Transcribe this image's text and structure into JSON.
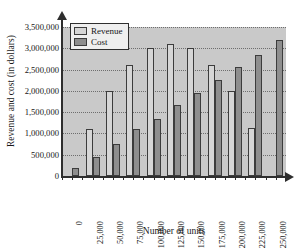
{
  "chart_data": {
    "type": "bar",
    "title": "",
    "xlabel": "Number of units",
    "ylabel": "Revenue and cost (in dollars)",
    "categories": [
      "0",
      "25,000",
      "50,000",
      "75,000",
      "100,000",
      "125,000",
      "150,000",
      "175,000",
      "200,000",
      "225,000",
      "250,000"
    ],
    "series": [
      {
        "name": "Revenue",
        "color": "#d6d6d6",
        "values": [
          0,
          1100000,
          2000000,
          2600000,
          3000000,
          3100000,
          3000000,
          2600000,
          2000000,
          1120000,
          0
        ]
      },
      {
        "name": "Cost",
        "color": "#8e8e8e",
        "values": [
          180000,
          450000,
          750000,
          1100000,
          1330000,
          1670000,
          1950000,
          2260000,
          2550000,
          2840000,
          3200000
        ]
      }
    ],
    "ylim": [
      0,
      3500000
    ],
    "ytick_labels": [
      "0",
      "500,000",
      "1,000,000",
      "1,500,000",
      "2,000,000",
      "2,500,000",
      "3,000,000",
      "3,500,000"
    ],
    "ytick_values": [
      0,
      500000,
      1000000,
      1500000,
      2000000,
      2500000,
      3000000,
      3500000
    ],
    "grid": true,
    "legend_position": "top-left",
    "legend_entries": [
      "Revenue",
      "Cost"
    ]
  },
  "plot_style": {
    "plot_background": "#c9c9c9",
    "page_background": "#ffffff",
    "axis_color": "#2e2e2e",
    "gridline_color": "#6e6e6e",
    "bar_border": "#3c3c3c"
  }
}
